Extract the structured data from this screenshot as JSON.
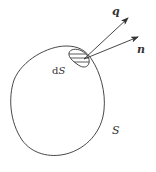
{
  "figure": {
    "type": "diagram",
    "colors": {
      "stroke": "#333333",
      "background": "#ffffff"
    },
    "labels": {
      "vector_q": "q",
      "vector_n": "n",
      "element_prefix": "d",
      "element_symbol": "S",
      "surface": "S"
    },
    "vectors": [
      {
        "name": "q",
        "from": [
          86,
          58
        ],
        "to": [
          128,
          18
        ]
      },
      {
        "name": "n",
        "from": [
          86,
          58
        ],
        "to": [
          138,
          37
        ]
      }
    ]
  }
}
